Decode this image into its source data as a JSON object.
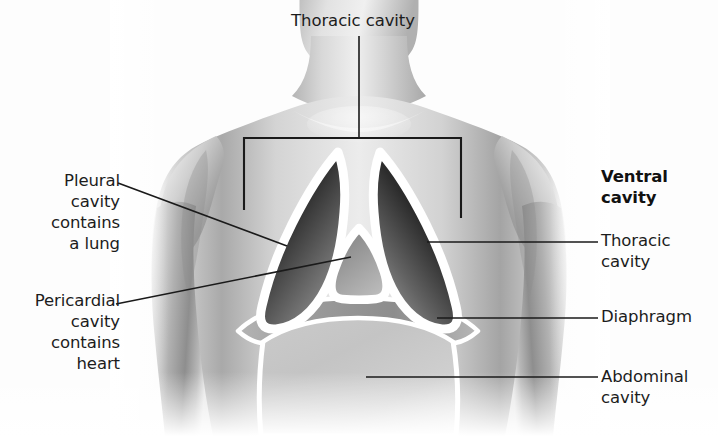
{
  "figure": {
    "background_color": "#fdfdfd",
    "line_color": "#1a1a1a",
    "membrane_color": "#ffffff"
  },
  "labels": {
    "thoracic_top": "Thoracic cavity",
    "pleural": "Pleural\ncavity\ncontains\na lung",
    "pericardial": "Pericardial\ncavity\ncontains\nheart",
    "ventral": "Ventral\ncavity",
    "thoracic_right": "Thoracic\ncavity",
    "diaphragm": "Diaphragm",
    "abdominal": "Abdominal\ncavity"
  },
  "structures": {
    "left_pleural_cavity": "left pleural cavity containing a lung",
    "right_pleural_cavity": "right pleural cavity containing a lung",
    "pericardial_cavity": "pericardial cavity containing the heart",
    "diaphragm": "diaphragm muscle separating thoracic and abdominal cavities",
    "abdominal_cavity": "abdominal cavity",
    "bracket": "bracket spanning the thoracic cavity"
  },
  "colors": {
    "skin_light": "#f2f2f2",
    "skin_mid": "#c9c9c9",
    "skin_shadow": "#8f8f8f",
    "cavity_dark": "#2a2a2a",
    "cavity_mid": "#5a5a5a",
    "cavity_light": "#9a9a9a",
    "abdomen_fill": "#c2c2c2",
    "membrane": "#ffffff",
    "leader": "#1a1a1a",
    "text": "#1c1c1c"
  }
}
